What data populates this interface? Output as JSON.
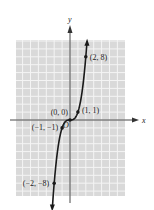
{
  "chart_data": {
    "type": "line",
    "title": "",
    "function": "y = x^3",
    "xlabel": "x",
    "ylabel": "y",
    "origin_label": "O",
    "xlim": [
      -7,
      6.5
    ],
    "ylim": [
      -9.5,
      10
    ],
    "grid": true,
    "points": [
      {
        "x": -2,
        "y": -8,
        "label": "(−2, −8)"
      },
      {
        "x": -1,
        "y": -1,
        "label": "(−1, −1)"
      },
      {
        "x": 0,
        "y": 0,
        "label": "(0, 0)"
      },
      {
        "x": 1,
        "y": 1,
        "label": "(1, 1)"
      },
      {
        "x": 2,
        "y": 8,
        "label": "(2, 8)"
      }
    ],
    "colors": {
      "grid_bg": "#d9d9d9",
      "grid_line": "#f4f4f4",
      "curve": "#1a1a1a",
      "axis": "#333333"
    }
  }
}
